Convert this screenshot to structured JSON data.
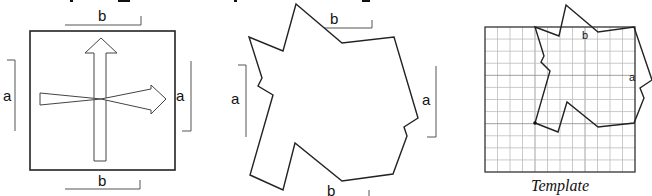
{
  "figure": {
    "colors": {
      "stroke": "#222222",
      "bracket": "#555555",
      "grid": "#b8b8b8",
      "background": "#ffffff"
    },
    "panels": [
      {
        "id": "square",
        "labels": {
          "top": "b",
          "bottom": "b",
          "left": "a",
          "right": "a"
        },
        "arrows": [
          "vertical-arrow-up",
          "horizontal-arrow-right"
        ]
      },
      {
        "id": "tessellation-tile",
        "labels": {
          "top": "b",
          "bottom": "b",
          "left": "a",
          "right": "a"
        }
      },
      {
        "id": "template",
        "labels": {
          "b": "b",
          "a": "a"
        },
        "grid": {
          "rows": 12,
          "cols": 12
        },
        "caption": "Template"
      }
    ]
  }
}
